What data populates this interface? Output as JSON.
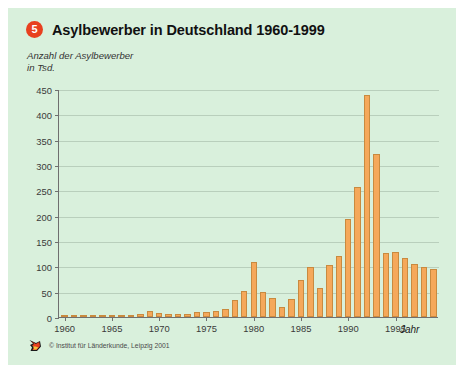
{
  "header": {
    "badge_number": "5",
    "title": "Asylbewerber in Deutschland 1960-1999",
    "subtitle": "Anzahl der Asylbewerber\nin Tsd."
  },
  "footer": {
    "logo_icon": "fox-head-logo-icon",
    "credit": "© Institut für Länderkunde, Leipzig 2001"
  },
  "colors": {
    "background": "#d9f0dc",
    "bar_fill": "#f5a85a",
    "bar_stroke": "#c98a3f",
    "axis": "#6f6f6f",
    "grid": "#b9cfbc",
    "badge": "#e8401f"
  },
  "chart_data": {
    "type": "bar",
    "title": "Asylbewerber in Deutschland 1960-1999",
    "subtitle": "Anzahl der Asylbewerber in Tsd.",
    "xlabel": "Jahr",
    "ylabel": "Anzahl der Asylbewerber in Tsd.",
    "ylim": [
      0,
      450
    ],
    "yticks": [
      0,
      50,
      100,
      150,
      200,
      250,
      300,
      350,
      400,
      450
    ],
    "ytick_labels": [
      "0",
      "50",
      "100",
      "150",
      "200",
      "250",
      "300",
      "350",
      "400",
      "450"
    ],
    "xlim": [
      1959.4,
      1999.6
    ],
    "xticks": [
      1960,
      1965,
      1970,
      1975,
      1980,
      1985,
      1990,
      1995
    ],
    "xtick_labels": [
      "1960",
      "1965",
      "1970",
      "1975",
      "1980",
      "1985",
      "1990",
      "1995"
    ],
    "grid": true,
    "legend": null,
    "categories": [
      1960,
      1961,
      1962,
      1963,
      1964,
      1965,
      1966,
      1967,
      1968,
      1969,
      1970,
      1971,
      1972,
      1973,
      1974,
      1975,
      1976,
      1977,
      1978,
      1979,
      1980,
      1981,
      1982,
      1983,
      1984,
      1985,
      1986,
      1987,
      1988,
      1989,
      1990,
      1991,
      1992,
      1993,
      1994,
      1995,
      1996,
      1997,
      1998,
      1999
    ],
    "values": [
      2.8,
      2.7,
      2.6,
      3.2,
      4.5,
      4.3,
      4.4,
      2.9,
      5.6,
      11.7,
      8.6,
      5.4,
      5.3,
      5.6,
      9.4,
      9.6,
      11.1,
      16.4,
      33.1,
      51.5,
      107.8,
      49.4,
      37.4,
      19.7,
      35.3,
      73.8,
      99.7,
      57.4,
      103.1,
      121.3,
      193.1,
      256.1,
      438.2,
      322.6,
      127.2,
      127.9,
      116.4,
      104.4,
      98.6,
      95.1
    ]
  }
}
